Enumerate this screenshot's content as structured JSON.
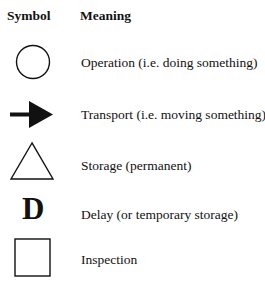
{
  "header": {
    "symbol": "Symbol",
    "meaning": "Meaning"
  },
  "rows": [
    {
      "icon": "circle-icon",
      "meaning": "Operation (i.e. doing something)"
    },
    {
      "icon": "arrow-right-icon",
      "meaning": "Transport (i.e. moving something)"
    },
    {
      "icon": "triangle-icon",
      "meaning": "Storage (permanent)"
    },
    {
      "icon": "letter-d-icon",
      "glyph": "D",
      "meaning": "Delay (or temporary storage)"
    },
    {
      "icon": "square-icon",
      "meaning": "Inspection"
    }
  ]
}
